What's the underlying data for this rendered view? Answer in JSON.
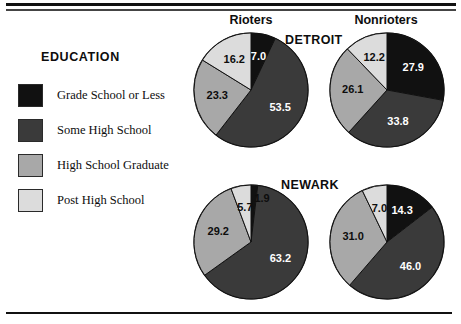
{
  "legend": {
    "title": "EDUCATION",
    "items": [
      {
        "label": "Grade School or Less",
        "color": "#111111"
      },
      {
        "label": "Some High School",
        "color": "#3a3a3a"
      },
      {
        "label": "High School Graduate",
        "color": "#a8a8a8"
      },
      {
        "label": "Post High School",
        "color": "#dcdcdc"
      }
    ]
  },
  "columns": {
    "rioters": "Rioters",
    "nonrioters": "Nonrioters"
  },
  "cities": {
    "detroit": "DETROIT",
    "newark": "NEWARK"
  },
  "chart_data": {
    "type": "pie",
    "title": "EDUCATION",
    "categories": [
      "Grade School or Less",
      "Some High School",
      "High School Graduate",
      "Post High School"
    ],
    "colors": [
      "#111111",
      "#3a3a3a",
      "#a8a8a8",
      "#dcdcdc"
    ],
    "units": "percent",
    "legend_position": "left",
    "grid": false,
    "charts": [
      {
        "city": "DETROIT",
        "group": "Rioters",
        "values": [
          7.0,
          53.5,
          23.3,
          16.2
        ],
        "labels": [
          "7.0",
          "53.5",
          "23.3",
          "16.2"
        ]
      },
      {
        "city": "DETROIT",
        "group": "Nonrioters",
        "values": [
          27.9,
          33.8,
          26.1,
          12.2
        ],
        "labels": [
          "27.9",
          "33.8",
          "26.1",
          "12.2"
        ]
      },
      {
        "city": "NEWARK",
        "group": "Rioters",
        "values": [
          1.9,
          63.2,
          29.2,
          5.7
        ],
        "labels": [
          "1.9",
          "63.2",
          "29.2",
          "5.7"
        ]
      },
      {
        "city": "NEWARK",
        "group": "Nonrioters",
        "values": [
          14.3,
          46.0,
          31.0,
          7.0
        ],
        "labels": [
          "14.3",
          "46.0",
          "31.0",
          "7.0"
        ]
      }
    ]
  }
}
